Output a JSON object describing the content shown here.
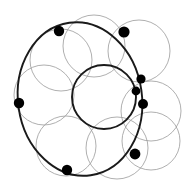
{
  "figure": {
    "canvas": {
      "width": 182,
      "height": 193,
      "background": "#ffffff"
    },
    "colors": {
      "dark_stroke": "#1a1a1a",
      "light_stroke": "#9a9a9a",
      "node_fill": "#000000",
      "background": "#ffffff"
    },
    "stroke_widths": {
      "outer_ellipse": 1.9,
      "central_circle": 1.9,
      "chain_circle": 0.8
    }
  },
  "chart_data": {
    "type": "scatter",
    "subtitle": "",
    "xlabel": "",
    "ylabel": "",
    "xlim": [
      0,
      182
    ],
    "ylim": [
      0,
      193
    ],
    "grid": false,
    "legend": "none",
    "annotations": [],
    "outer_ellipse": {
      "name": "outer-ellipse",
      "cx": 80,
      "cy": 99,
      "rx": 62,
      "ry": 77,
      "rotation": -8,
      "stroke": "#1a1a1a",
      "stroke_width": 1.9
    },
    "central_circle": {
      "name": "central-circle",
      "cx": 104,
      "cy": 97,
      "r": 32,
      "stroke": "#1a1a1a",
      "stroke_width": 1.9
    },
    "chain_circles": [
      {
        "name": "chain-circle-1",
        "cx": 94,
        "cy": 46,
        "r": 31
      },
      {
        "name": "chain-circle-2",
        "cx": 139,
        "cy": 51,
        "r": 31
      },
      {
        "name": "chain-circle-3",
        "cx": 151,
        "cy": 111,
        "r": 30
      },
      {
        "name": "chain-circle-4",
        "cx": 117,
        "cy": 148,
        "r": 31
      },
      {
        "name": "chain-circle-5",
        "cx": 66,
        "cy": 146,
        "r": 30
      },
      {
        "name": "chain-circle-6",
        "cx": 44,
        "cy": 95,
        "r": 30
      },
      {
        "name": "chain-circle-7",
        "cx": 61,
        "cy": 60,
        "r": 31
      },
      {
        "name": "chain-circle-8",
        "cx": 151,
        "cy": 141,
        "r": 29
      }
    ],
    "nodes": [
      {
        "name": "node-top-left",
        "x": 59,
        "y": 31,
        "r": 5.2
      },
      {
        "name": "node-top-right",
        "x": 124,
        "y": 32,
        "r": 5.6
      },
      {
        "name": "node-right-upper",
        "x": 141,
        "y": 79,
        "r": 4.6
      },
      {
        "name": "node-right-middle",
        "x": 136,
        "y": 91,
        "r": 4.4
      },
      {
        "name": "node-right-lower",
        "x": 143,
        "y": 104,
        "r": 5.0
      },
      {
        "name": "node-bottom-right",
        "x": 135,
        "y": 154,
        "r": 5.4
      },
      {
        "name": "node-bottom-left",
        "x": 67,
        "y": 170,
        "r": 5.2
      },
      {
        "name": "node-left",
        "x": 19,
        "y": 103,
        "r": 5.2
      }
    ],
    "counts": {
      "outer_ellipse": 1,
      "central_circle": 1,
      "chain_circles": 8,
      "nodes": 8
    }
  }
}
